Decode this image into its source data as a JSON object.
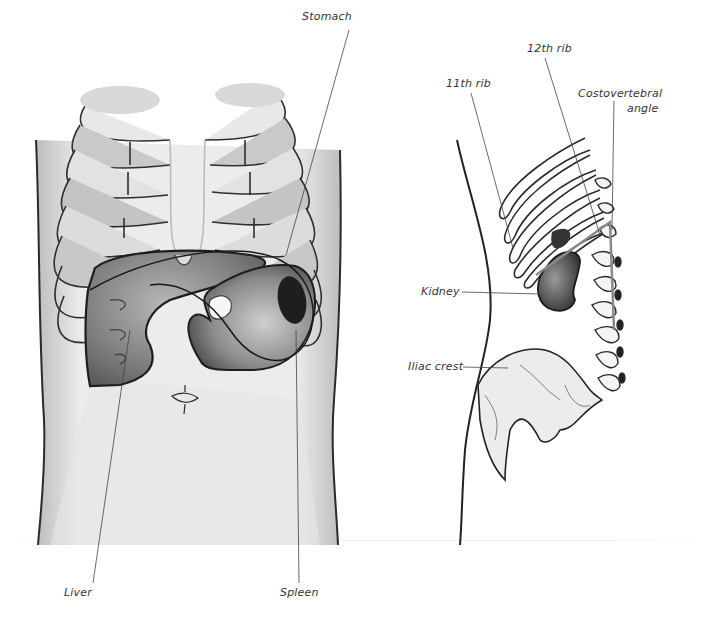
{
  "figures": [
    {
      "id": "anterior-abdomen",
      "description": "Anterior view of torso showing ribs, liver, stomach and spleen",
      "labels": {
        "stomach": "Stomach",
        "liver": "Liver",
        "spleen": "Spleen"
      }
    },
    {
      "id": "posterior-flank",
      "description": "Posterior/lateral view showing ribs, kidney, spine and iliac crest",
      "labels": {
        "rib12": "12th rib",
        "rib11": "11th rib",
        "cva_line1": "Costovertebral",
        "cva_line2": "angle",
        "kidney": "Kidney",
        "iliac": "Iliac crest"
      }
    }
  ],
  "colors": {
    "ink": "#2a2a2a",
    "shade_light": "#d4d4d4",
    "shade_mid": "#9a9a9a",
    "shade_dark": "#4a4a4a",
    "spleen": "#1e1e1e",
    "cva_marker": "#8a8a8a"
  }
}
